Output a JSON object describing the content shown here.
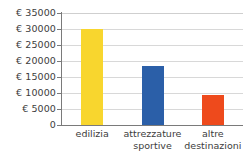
{
  "chart_data": {
    "type": "bar",
    "title": "",
    "subtitle": "",
    "xlabel": "",
    "ylabel": "",
    "categories": [
      "edilizia",
      "attrezzature sportive",
      "altre destinazioni"
    ],
    "category_lines": [
      [
        "edilizia"
      ],
      [
        "attrezzature",
        "sportive"
      ],
      [
        "altre",
        "destinazioni"
      ]
    ],
    "values": [
      30000,
      18500,
      9500
    ],
    "series": [
      {
        "name": "destinazione fondi",
        "values": [
          30000,
          18500,
          9500
        ]
      }
    ],
    "bar_colors": [
      "#F8D62E",
      "#2B5FA8",
      "#EE4A1C"
    ],
    "ylim": [
      0,
      35000
    ],
    "ytick_values": [
      35000,
      30000,
      25000,
      20000,
      15000,
      10000,
      5000,
      0
    ],
    "ytick_labels": [
      "€ 35000",
      "€ 30000",
      "€ 25000",
      "€ 20000",
      "€ 15000",
      "€ 10000",
      "€ 5000",
      "0"
    ],
    "grid": true,
    "grid_color": "#D8D8D8",
    "axis_color": "#7A7A7A",
    "legend": false,
    "legend_position": "none",
    "currency_symbol": "€",
    "annotations": []
  }
}
